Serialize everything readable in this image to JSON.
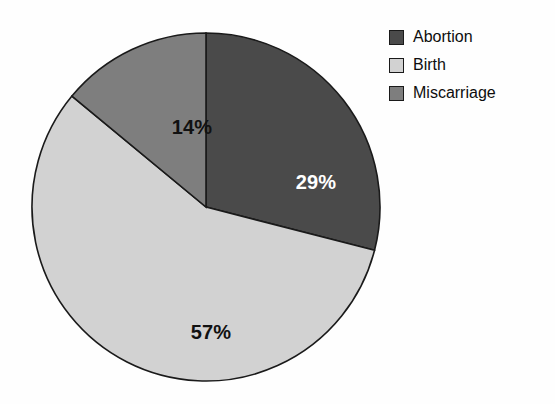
{
  "chart_data": {
    "type": "pie",
    "title": "",
    "subtitle": "",
    "xlabel": "",
    "ylabel": "",
    "legend_position": "top-right",
    "grid": false,
    "start_angle_deg": 0,
    "direction": "clockwise",
    "categories": [
      "Abortion",
      "Birth",
      "Miscarriage"
    ],
    "values": [
      29,
      57,
      14
    ],
    "unit": "%",
    "data_labels": [
      "29%",
      "57%",
      "14%"
    ],
    "slice_colors": [
      "#4a4a4a",
      "#d2d2d2",
      "#7e7e7e"
    ],
    "data_label_colors": [
      "#ffffff",
      "#111111",
      "#111111"
    ],
    "outline_color": "#1a1a1a",
    "slices": [
      {
        "name": "Abortion",
        "value": 29,
        "label": "29%",
        "color": "#4a4a4a",
        "label_color": "#ffffff"
      },
      {
        "name": "Birth",
        "value": 57,
        "label": "57%",
        "color": "#d2d2d2",
        "label_color": "#111111"
      },
      {
        "name": "Miscarriage",
        "value": 14,
        "label": "14%",
        "color": "#7e7e7e",
        "label_color": "#111111"
      }
    ]
  },
  "legend": {
    "items": [
      {
        "label": "Abortion",
        "color": "#4a4a4a"
      },
      {
        "label": "Birth",
        "color": "#d2d2d2"
      },
      {
        "label": "Miscarriage",
        "color": "#7e7e7e"
      }
    ]
  }
}
